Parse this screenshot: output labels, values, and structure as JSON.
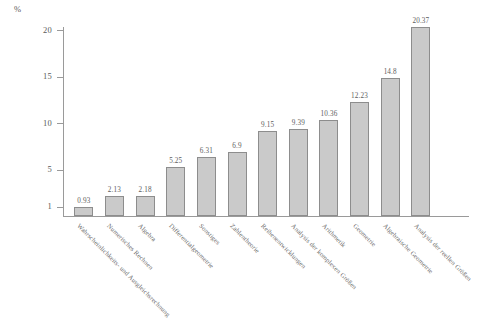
{
  "chart_data": {
    "type": "bar",
    "title": "",
    "subtitle": "",
    "xlabel": "",
    "ylabel": "%",
    "ylim": [
      1,
      20
    ],
    "grid": false,
    "legend": null,
    "y_ticks": [
      "20",
      "15",
      "10",
      "5",
      "1"
    ],
    "y_unit_label": "%",
    "categories": [
      "Wahrscheinlichkeits- und Ausgleichsrechnung",
      "Numerisches Rechnen",
      "Algebra",
      "Differentialgeometrie",
      "Sonstiges",
      "Zahlentheorie",
      "Reihenentwicklungen",
      "Analysis der komplexen Größen",
      "Arithmetik",
      "Geometrie",
      "Algebraische Geometrie",
      "Analysis der reellen Größen"
    ],
    "values": [
      0.93,
      2.13,
      2.18,
      5.25,
      6.31,
      6.9,
      9.15,
      9.39,
      10.36,
      12.23,
      14.8,
      20.37
    ],
    "value_labels": [
      "0.93",
      "2.13",
      "2.18",
      "5.25",
      "6.31",
      "6.9",
      "9.15",
      "9.39",
      "10.36",
      "12.23",
      "14.8",
      "20.37"
    ],
    "bar_color": "#cacaca",
    "bar_border_color": "#8d8d8d",
    "axis_color": "#9a9a9a",
    "text_color": "#5d5d5d"
  }
}
